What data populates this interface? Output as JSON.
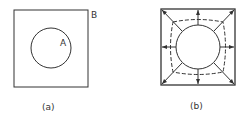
{
  "panels": [
    {
      "caption": "(a)",
      "labels": {
        "circle": "A",
        "square": "B"
      }
    },
    {
      "caption": "(b)"
    }
  ]
}
